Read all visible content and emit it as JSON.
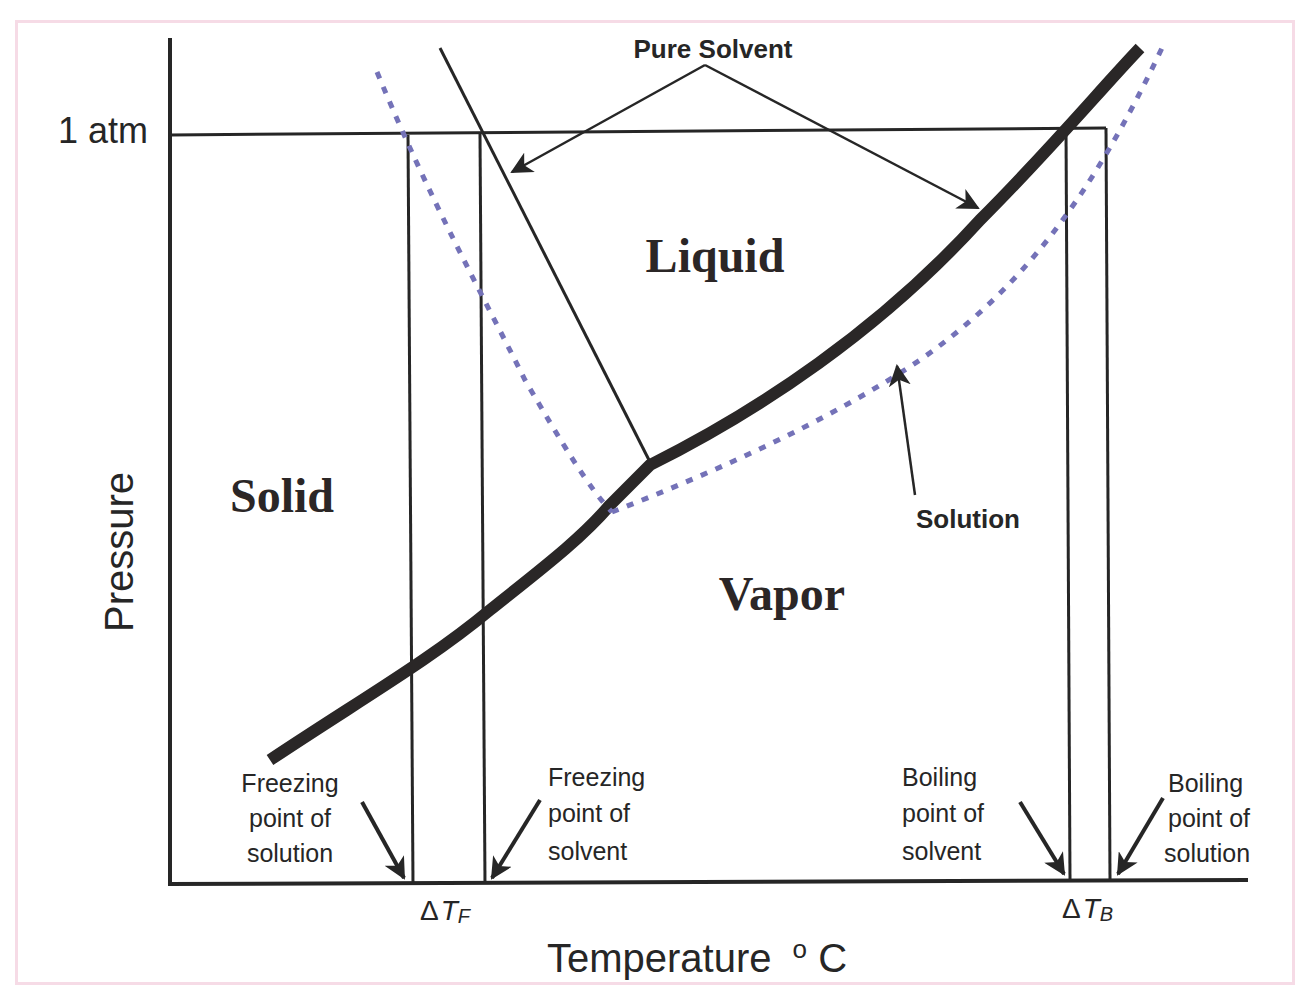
{
  "diagram": {
    "axes": {
      "y_label": "Pressure",
      "x_label": "Temperature",
      "x_unit_sup": "o",
      "x_unit": "C",
      "pressure_mark": "1 atm"
    },
    "regions": {
      "solid": "Solid",
      "liquid": "Liquid",
      "vapor": "Vapor"
    },
    "curve_labels": {
      "pure_solvent": "Pure Solvent",
      "solution": "Solution"
    },
    "points": {
      "fp_solution": [
        "Freezing",
        "point of",
        "solution"
      ],
      "fp_solvent": [
        "Freezing",
        "point of",
        "solvent"
      ],
      "bp_solvent": [
        "Boiling",
        "point of",
        "solvent"
      ],
      "bp_solution": [
        "Boiling",
        "point of",
        "solution"
      ]
    },
    "deltas": {
      "freezing_delta": "Δ",
      "freezing_T": "T",
      "freezing_sub": "F",
      "boiling_delta": "Δ",
      "boiling_T": "T",
      "boiling_sub": "B"
    },
    "colors": {
      "ink": "#262626",
      "solution_dotted": "#7472b8",
      "frame_border": "#f6dbe6",
      "background": "#ffffff"
    }
  }
}
